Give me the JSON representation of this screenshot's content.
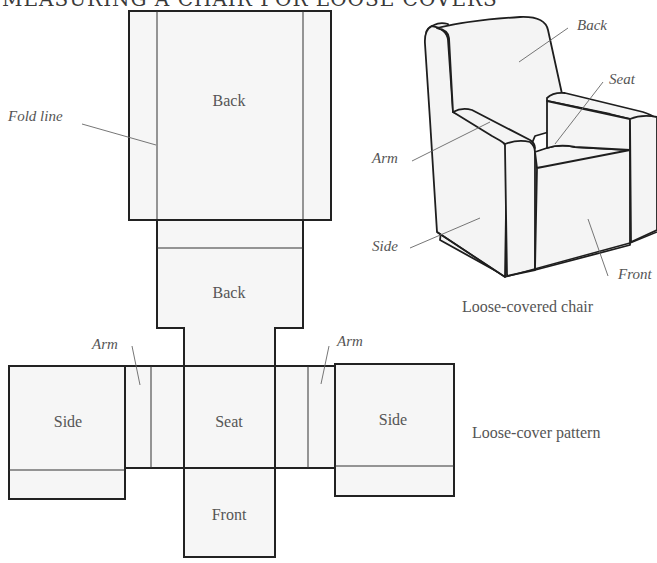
{
  "title": "MEASURING A CHAIR FOR LOOSE COVERS",
  "pattern": {
    "caption": "Loose-cover pattern",
    "pieces": {
      "back_top": "Back",
      "back_lower": "Back",
      "seat": "Seat",
      "front": "Front",
      "side_left": "Side",
      "side_right": "Side"
    },
    "callouts": {
      "fold_line": "Fold line",
      "arm_left": "Arm",
      "arm_right": "Arm"
    }
  },
  "chair": {
    "caption": "Loose-covered chair",
    "callouts": {
      "back": "Back",
      "seat": "Seat",
      "arm": "Arm",
      "side": "Side",
      "front": "Front"
    }
  }
}
